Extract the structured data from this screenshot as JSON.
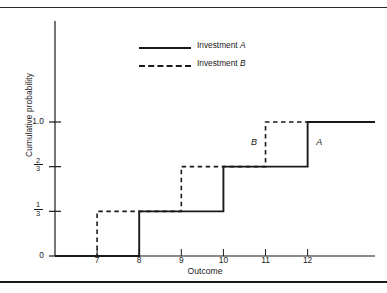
{
  "chart_data": {
    "type": "line",
    "title": "",
    "subtitle": "",
    "xlabel": "Outcome",
    "ylabel": "Cumulative probability",
    "xlim": [
      6.0,
      13.6
    ],
    "ylim": [
      0,
      1.12
    ],
    "grid": false,
    "legend_position": "top-center",
    "step_type": "post",
    "x_ticks": [
      7,
      8,
      9,
      10,
      11,
      12
    ],
    "x_tick_labels": [
      "7",
      "8",
      "9",
      "10",
      "11",
      "12"
    ],
    "y_ticks": [
      0,
      0.3333,
      0.6667,
      1.0
    ],
    "y_tick_labels": [
      "0",
      "1/3",
      "2/3",
      "1.0"
    ],
    "y_tick_fractions": [
      {
        "value": 0,
        "whole": "0",
        "num": "",
        "den": ""
      },
      {
        "value": 0.3333,
        "whole": "",
        "num": "1",
        "den": "3"
      },
      {
        "value": 0.6667,
        "whole": "",
        "num": "2",
        "den": "3"
      },
      {
        "value": 1.0,
        "whole": "1.0",
        "num": "",
        "den": ""
      }
    ],
    "series": [
      {
        "name": "Investment A",
        "label": "A",
        "style": "solid",
        "color": "#1a1a1a",
        "jumps": [
          {
            "x": 8,
            "y": 0.3333
          },
          {
            "x": 10,
            "y": 0.6667
          },
          {
            "x": 12,
            "y": 1.0
          }
        ],
        "x": [
          6.0,
          8,
          8,
          10,
          10,
          12,
          12,
          13.6
        ],
        "y": [
          0,
          0,
          0.3333,
          0.3333,
          0.6667,
          0.6667,
          1.0,
          1.0
        ]
      },
      {
        "name": "Investment B",
        "label": "B",
        "style": "dashed",
        "color": "#1a1a1a",
        "jumps": [
          {
            "x": 7,
            "y": 0.3333
          },
          {
            "x": 9,
            "y": 0.6667
          },
          {
            "x": 11,
            "y": 1.0
          }
        ],
        "x": [
          6.0,
          7,
          7,
          9,
          9,
          11,
          11,
          13.6
        ],
        "y": [
          0,
          0,
          0.3333,
          0.3333,
          0.6667,
          0.6667,
          1.0,
          1.0
        ]
      }
    ],
    "annotations": [
      {
        "text": "B",
        "x": 10.75,
        "y": 0.84
      },
      {
        "text": "A",
        "x": 12.3,
        "y": 0.84
      }
    ]
  },
  "legend": {
    "items": [
      {
        "prefix": "Investment ",
        "symbol": "A",
        "style": "solid"
      },
      {
        "prefix": "Investment ",
        "symbol": "B",
        "style": "dashed"
      }
    ]
  }
}
